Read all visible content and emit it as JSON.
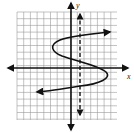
{
  "diagram": {
    "type": "coordinate-graph",
    "axes": {
      "x_label": "x",
      "y_label": "y"
    },
    "grid": {
      "left": 17,
      "top": 12,
      "right": 117,
      "bottom": 120,
      "spacing": 6.7,
      "color": "#9a9a9a"
    },
    "origin_px": {
      "x": 71,
      "y": 68
    },
    "curve": {
      "color": "#1a1a1a",
      "path": "M110,32 C90,34 70,36 60,40 C48,45 52,52 62,56 C80,62 100,66 106,72 C112,78 100,84 80,86 C62,89 50,91 37,92",
      "top_arrow_tip": [
        110,
        32
      ],
      "bottom_arrow_tip": [
        37,
        92
      ]
    },
    "dashed_line": {
      "x": 80,
      "y1": 14,
      "y2": 115,
      "color": "#1a1a1a"
    },
    "colors": {
      "axis": "#111111",
      "background": "#ffffff"
    }
  }
}
